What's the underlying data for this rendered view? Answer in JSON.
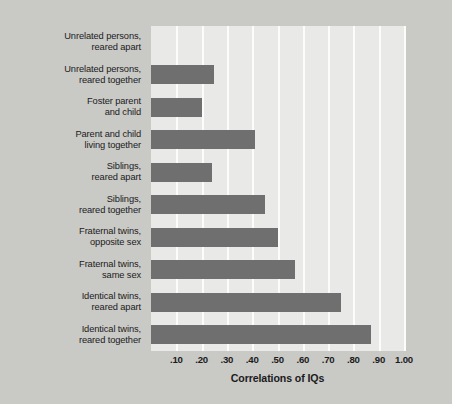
{
  "chart_data": {
    "type": "bar",
    "orientation": "horizontal",
    "title": "",
    "xlabel": "Correlations of IQs",
    "ylabel": "",
    "xlim": [
      0.0,
      1.0
    ],
    "grid": true,
    "legend": "none",
    "bar_color": "#6f6f6f",
    "plot_background": "#e9e9e7",
    "figure_background": "#c9c9c6",
    "categories": [
      "Unrelated persons, reared apart",
      "Unrelated persons, reared together",
      "Foster parent and child",
      "Parent and child living together",
      "Siblings, reared apart",
      "Siblings, reared together",
      "Fraternal twins, opposite sex",
      "Fraternal twins, same sex",
      "Identical twins, reared apart",
      "Identical twins, reared together"
    ],
    "values": [
      0.0,
      0.25,
      0.2,
      0.41,
      0.24,
      0.45,
      0.5,
      0.57,
      0.75,
      0.87
    ],
    "xticks": [
      0.1,
      0.2,
      0.3,
      0.4,
      0.5,
      0.6,
      0.7,
      0.8,
      0.9,
      1.0
    ],
    "xtick_labels": [
      ".10",
      ".20",
      ".30",
      ".40",
      ".50",
      ".60",
      ".70",
      ".80",
      ".90",
      "1.00"
    ]
  },
  "labels": {
    "rows": [
      {
        "line1": "Unrelated persons,",
        "line2": "reared apart"
      },
      {
        "line1": "Unrelated persons,",
        "line2": "reared together"
      },
      {
        "line1": "Foster parent",
        "line2": "and child"
      },
      {
        "line1": "Parent and child",
        "line2": "living together"
      },
      {
        "line1": "Siblings,",
        "line2": "reared apart"
      },
      {
        "line1": "Siblings,",
        "line2": "reared together"
      },
      {
        "line1": "Fraternal twins,",
        "line2": "opposite sex"
      },
      {
        "line1": "Fraternal twins,",
        "line2": "same sex"
      },
      {
        "line1": "Identical twins,",
        "line2": "reared apart"
      },
      {
        "line1": "Identical twins,",
        "line2": "reared together"
      }
    ]
  }
}
